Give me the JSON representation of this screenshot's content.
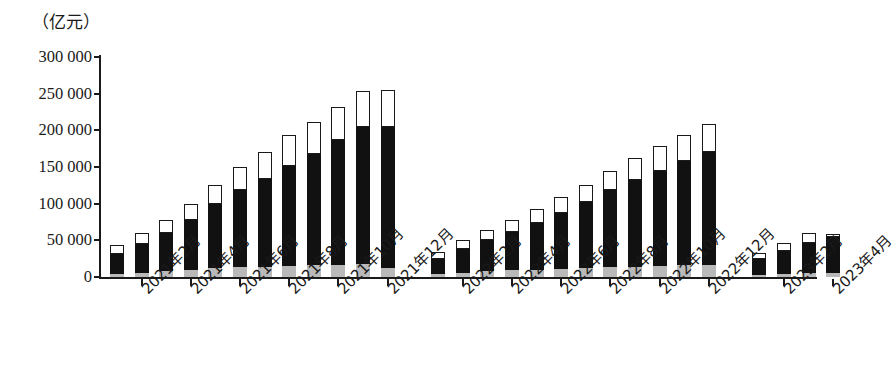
{
  "chart_data": {
    "type": "bar",
    "title": "",
    "subtitle": "",
    "xlabel": "",
    "ylabel": "（亿元）",
    "unit_label": "（亿元）",
    "stacked": true,
    "grid": false,
    "legend_position": "none",
    "ylim": [
      0,
      300000
    ],
    "ytick_step": 50000,
    "ytick_labels": [
      "300 000",
      "250 000",
      "200 000",
      "150 000",
      "100 000",
      "50 000",
      "0"
    ],
    "ytick_values": [
      300000,
      250000,
      200000,
      150000,
      100000,
      50000,
      0
    ],
    "series": [
      {
        "name": "bottom-segment",
        "color": "#b9b9b9",
        "style": "gray"
      },
      {
        "name": "middle-segment",
        "color": "#111111",
        "style": "black"
      },
      {
        "name": "top-segment",
        "color": "#ffffff",
        "style": "white-outlined"
      }
    ],
    "groups": [
      {
        "name": "2021",
        "categories": [
          "2021年1月",
          "2021年2月",
          "2021年3月",
          "2021年4月",
          "2021年5月",
          "2021年6月",
          "2021年7月",
          "2021年8月",
          "2021年9月",
          "2021年10月",
          "2021年11月",
          "2021年12月"
        ],
        "bars": [
          {
            "gray": 4000,
            "black": 28000,
            "white": 11000,
            "total": 43000
          },
          {
            "gray": 6000,
            "black": 39000,
            "white": 15000,
            "total": 60000
          },
          {
            "gray": 8000,
            "black": 52000,
            "white": 18000,
            "total": 78000
          },
          {
            "gray": 10000,
            "black": 68000,
            "white": 22000,
            "total": 100000
          },
          {
            "gray": 12000,
            "black": 88000,
            "white": 25000,
            "total": 125000
          },
          {
            "gray": 13000,
            "black": 106000,
            "white": 31000,
            "total": 150000
          },
          {
            "gray": 14000,
            "black": 119000,
            "white": 37000,
            "total": 170000
          },
          {
            "gray": 15000,
            "black": 136000,
            "white": 42000,
            "total": 193000
          },
          {
            "gray": 16000,
            "black": 152000,
            "white": 43000,
            "total": 211000
          },
          {
            "gray": 17000,
            "black": 170000,
            "white": 45000,
            "total": 232000
          },
          {
            "gray": 18000,
            "black": 186000,
            "white": 50000,
            "total": 254000
          },
          {
            "gray": 12000,
            "black": 193000,
            "white": 50000,
            "total": 255000
          }
        ]
      },
      {
        "name": "2022",
        "categories": [
          "2022年1月",
          "2022年2月",
          "2022年3月",
          "2022年4月",
          "2022年5月",
          "2022年6月",
          "2022年7月",
          "2022年8月",
          "2022年9月",
          "2022年10月",
          "2022年11月",
          "2022年12月"
        ],
        "bars": [
          {
            "gray": 4000,
            "black": 21000,
            "white": 9000,
            "total": 34000
          },
          {
            "gray": 6000,
            "black": 32000,
            "white": 12000,
            "total": 50000
          },
          {
            "gray": 8000,
            "black": 42000,
            "white": 14000,
            "total": 64000
          },
          {
            "gray": 9000,
            "black": 52000,
            "white": 17000,
            "total": 78000
          },
          {
            "gray": 10000,
            "black": 64000,
            "white": 19000,
            "total": 93000
          },
          {
            "gray": 11000,
            "black": 76000,
            "white": 22000,
            "total": 109000
          },
          {
            "gray": 12000,
            "black": 90000,
            "white": 24000,
            "total": 126000
          },
          {
            "gray": 13000,
            "black": 105000,
            "white": 27000,
            "total": 145000
          },
          {
            "gray": 14000,
            "black": 118000,
            "white": 30000,
            "total": 162000
          },
          {
            "gray": 15000,
            "black": 130000,
            "white": 33000,
            "total": 178000
          },
          {
            "gray": 16000,
            "black": 142000,
            "white": 36000,
            "total": 194000
          },
          {
            "gray": 17000,
            "black": 153000,
            "white": 39000,
            "total": 199000
          }
        ]
      },
      {
        "name": "2023",
        "categories": [
          "2023年1月",
          "2023年2月",
          "2023年3月",
          "2023年4月"
        ],
        "bars": [
          {
            "gray": 3000,
            "black": 22000,
            "white": 8000,
            "total": 33000
          },
          {
            "gray": 4000,
            "black": 32000,
            "white": 10000,
            "total": 46000
          },
          {
            "gray": 5000,
            "black": 42000,
            "white": 13000,
            "total": 60000
          },
          {
            "gray": 5000,
            "black": 50000,
            "white": 3000,
            "total": 58000
          }
        ]
      }
    ],
    "xtick_labels": [
      "2021年2月",
      "2021年4月",
      "2021年6月",
      "2021年8月",
      "2021年10月",
      "2021年12月",
      "2022年2月",
      "2022年4月",
      "2022年6月",
      "2022年8月",
      "2022年10月",
      "2022年12月",
      "2023年2月",
      "2023年4月"
    ]
  }
}
